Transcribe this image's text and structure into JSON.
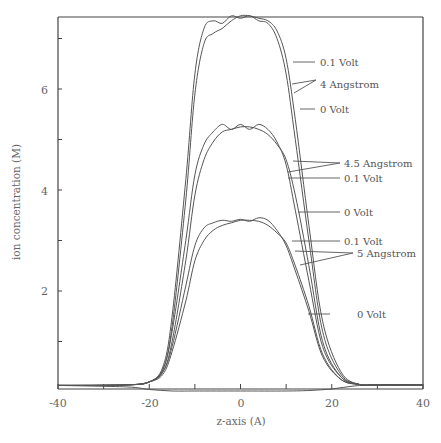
{
  "chart_data": {
    "type": "line",
    "title": "",
    "xlabel": "z-axis (A)",
    "ylabel": "ion concentration (M)",
    "xlim": [
      -40,
      40
    ],
    "ylim": [
      0,
      7.5
    ],
    "x_ticks": [
      -40,
      -30,
      -20,
      -10,
      0,
      10,
      20,
      30,
      40
    ],
    "x_tick_labels": [
      "-40",
      "-20",
      "0",
      "20",
      "40"
    ],
    "y_ticks": [
      1,
      2,
      3,
      4,
      5,
      6,
      7
    ],
    "y_tick_labels": [
      "2",
      "4",
      "6"
    ],
    "grid": false,
    "legend_position": "annotations-right",
    "series": [
      {
        "name": "4 Angstrom, 0.1 Volt",
        "group": "4 Angstrom",
        "x": [
          -40,
          -25,
          -20,
          -17,
          -15,
          -12,
          -10,
          -8,
          -6,
          -4,
          -2,
          0,
          2,
          4,
          6,
          8,
          10,
          12,
          15,
          18,
          22,
          26,
          30,
          40
        ],
        "values": [
          0.13,
          0.14,
          0.2,
          0.5,
          1.5,
          4.2,
          6.3,
          7.2,
          7.35,
          7.3,
          7.45,
          7.4,
          7.45,
          7.35,
          7.3,
          7.0,
          6.3,
          5.0,
          3.0,
          1.2,
          0.35,
          0.15,
          0.14,
          0.14
        ]
      },
      {
        "name": "4 Angstrom, 0 Volt",
        "group": "4 Angstrom",
        "x": [
          -40,
          -25,
          -20,
          -17,
          -15,
          -12,
          -10,
          -8,
          -6,
          -4,
          -2,
          0,
          2,
          4,
          6,
          8,
          10,
          12,
          15,
          18,
          22,
          26,
          30,
          40
        ],
        "values": [
          0.13,
          0.14,
          0.2,
          0.45,
          1.3,
          3.8,
          5.9,
          6.9,
          7.1,
          7.2,
          7.35,
          7.45,
          7.45,
          7.4,
          7.35,
          7.15,
          6.6,
          5.4,
          3.3,
          1.4,
          0.4,
          0.15,
          0.14,
          0.14
        ]
      },
      {
        "name": "4.5 Angstrom, 0.1 Volt",
        "group": "4.5 Angstrom",
        "x": [
          -40,
          -25,
          -20,
          -17,
          -15,
          -12,
          -10,
          -8,
          -6,
          -4,
          -2,
          0,
          2,
          4,
          6,
          8,
          10,
          12,
          15,
          18,
          22,
          26,
          30,
          40
        ],
        "values": [
          0.13,
          0.14,
          0.2,
          0.45,
          1.2,
          3.0,
          4.3,
          4.9,
          5.15,
          5.3,
          5.2,
          5.3,
          5.2,
          5.3,
          5.2,
          4.95,
          4.5,
          3.6,
          2.2,
          0.9,
          0.3,
          0.15,
          0.14,
          0.14
        ]
      },
      {
        "name": "4.5 Angstrom, 0 Volt",
        "group": "4.5 Angstrom",
        "x": [
          -40,
          -25,
          -20,
          -17,
          -15,
          -12,
          -10,
          -8,
          -6,
          -4,
          -2,
          0,
          2,
          4,
          6,
          8,
          10,
          12,
          15,
          18,
          22,
          26,
          30,
          40
        ],
        "values": [
          0.13,
          0.14,
          0.2,
          0.4,
          1.0,
          2.6,
          3.9,
          4.6,
          4.95,
          5.15,
          5.2,
          5.25,
          5.25,
          5.2,
          5.1,
          4.9,
          4.6,
          3.9,
          2.5,
          1.0,
          0.3,
          0.15,
          0.14,
          0.14
        ]
      },
      {
        "name": "5 Angstrom, 0.1 Volt",
        "group": "5 Angstrom",
        "x": [
          -40,
          -25,
          -20,
          -17,
          -15,
          -12,
          -10,
          -8,
          -6,
          -4,
          -2,
          0,
          2,
          4,
          6,
          8,
          10,
          12,
          15,
          18,
          22,
          26,
          30,
          40
        ],
        "values": [
          0.13,
          0.14,
          0.2,
          0.4,
          0.9,
          2.1,
          2.9,
          3.25,
          3.35,
          3.4,
          3.38,
          3.42,
          3.38,
          3.45,
          3.4,
          3.2,
          2.9,
          2.4,
          1.6,
          0.7,
          0.25,
          0.15,
          0.14,
          0.14
        ]
      },
      {
        "name": "5 Angstrom, 0 Volt",
        "group": "5 Angstrom",
        "x": [
          -40,
          -25,
          -20,
          -17,
          -15,
          -12,
          -10,
          -8,
          -6,
          -4,
          -2,
          0,
          2,
          4,
          6,
          8,
          10,
          12,
          15,
          18,
          22,
          26,
          30,
          40
        ],
        "values": [
          0.13,
          0.14,
          0.2,
          0.35,
          0.8,
          1.8,
          2.6,
          3.0,
          3.2,
          3.3,
          3.35,
          3.4,
          3.4,
          3.38,
          3.3,
          3.15,
          2.95,
          2.5,
          1.7,
          0.75,
          0.25,
          0.15,
          0.14,
          0.14
        ]
      },
      {
        "name": "baseline (low-concentration species)",
        "group": "other",
        "x": [
          -40,
          -25,
          -20,
          -15,
          -10,
          0,
          10,
          15,
          20,
          25,
          30,
          40
        ],
        "values": [
          0.13,
          0.1,
          0.05,
          0.02,
          0.02,
          0.02,
          0.02,
          0.03,
          0.06,
          0.12,
          0.14,
          0.14
        ]
      }
    ],
    "annotations": [
      {
        "text": "0.1 Volt",
        "x_px": 320,
        "y_px": 60
      },
      {
        "text": "4 Angstrom",
        "x_px": 320,
        "y_px": 84
      },
      {
        "text": "0 Volt",
        "x_px": 320,
        "y_px": 109
      },
      {
        "text": "0.1 Volt",
        "x_px": 345,
        "y_px": 178
      },
      {
        "text": "4.5 Angstrom",
        "x_px": 345,
        "y_px": 200
      },
      {
        "text": "0 Volt",
        "x_px": 345,
        "y_px": 241
      },
      {
        "text": "0.1 Volt",
        "x_px": 345,
        "y_px": 266
      },
      {
        "text": "5 Angstrom",
        "x_px": 358,
        "y_px": 285
      },
      {
        "text": "0 Volt",
        "x_px": 358,
        "y_px": 346
      }
    ]
  },
  "labels": {
    "xlabel": "z-axis (A)",
    "ylabel": "ion concentration (M)",
    "xt0": "-40",
    "xt1": "-20",
    "xt2": "0",
    "xt3": "20",
    "xt4": "40",
    "yt0": "2",
    "yt1": "4",
    "yt2": "6",
    "a0": "0.1 Volt",
    "a1": "4 Angstrom",
    "a2": "0 Volt",
    "a3": "0.1 Volt",
    "a4": "4.5 Angstrom",
    "a5": "0 Volt",
    "a6": "0.1 Volt",
    "a7": "5 Angstrom",
    "a8": "0 Volt"
  },
  "style": {
    "line_color": "#555555",
    "axis_color": "#444444"
  }
}
